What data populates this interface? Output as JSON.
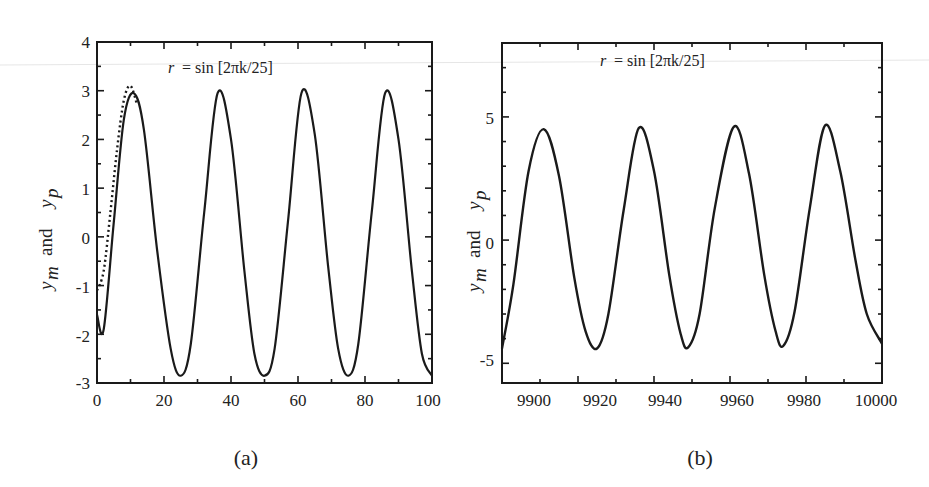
{
  "chart_data": [
    {
      "panel": "(a)",
      "type": "line",
      "annotation": "r = sin[2πk/25]",
      "ylabel": "y_m and y_p",
      "xlabel": "",
      "xlim": [
        0,
        100
      ],
      "ylim": [
        -3,
        4
      ],
      "xticks": [
        0,
        20,
        40,
        60,
        80,
        100
      ],
      "yticks": [
        -3,
        -2,
        -1,
        0,
        1,
        2,
        3,
        4
      ],
      "grid": false,
      "legend": null,
      "series": [
        {
          "name": "y_m (solid)",
          "style": "solid",
          "x": [
            0,
            2,
            5,
            8,
            11,
            14,
            18,
            22,
            25,
            28,
            32,
            36,
            40,
            44,
            47,
            50,
            53,
            57,
            61,
            65,
            69,
            72,
            75,
            78,
            82,
            86,
            90,
            94,
            97,
            100
          ],
          "y": [
            -1.6,
            -1.9,
            0.3,
            2.4,
            2.95,
            2.2,
            -0.3,
            -2.3,
            -2.85,
            -2.2,
            0.5,
            2.95,
            2.0,
            -0.7,
            -2.4,
            -2.85,
            -2.3,
            0.3,
            2.95,
            2.1,
            -0.6,
            -2.3,
            -2.85,
            -2.2,
            0.5,
            2.95,
            2.0,
            -0.7,
            -2.4,
            -2.85
          ]
        },
        {
          "name": "y_p (dotted)",
          "style": "dotted",
          "x": [
            0,
            2,
            4,
            6,
            8,
            10,
            12
          ],
          "y": [
            -1.1,
            -0.7,
            0.5,
            1.8,
            2.8,
            3.1,
            2.7
          ]
        }
      ]
    },
    {
      "panel": "(b)",
      "type": "line",
      "annotation": "r = sin[2πk/25]",
      "ylabel": "y_m and y_p",
      "xlabel": "",
      "xlim": [
        9900,
        10000
      ],
      "ylim": [
        -5.8,
        8
      ],
      "xticks": [
        9900,
        9920,
        9940,
        9960,
        9980,
        10000
      ],
      "yticks": [
        -5,
        0,
        5
      ],
      "grid": false,
      "legend": null,
      "series": [
        {
          "name": "y_m and y_p (overlapping)",
          "style": "solid",
          "x": [
            9900,
            9903,
            9907,
            9911,
            9915,
            9919,
            9922,
            9925,
            9928,
            9932,
            9936,
            9940,
            9944,
            9947,
            9949,
            9952,
            9956,
            9961,
            9965,
            9969,
            9972,
            9974,
            9977,
            9981,
            9985,
            9989,
            9993,
            9996,
            10000
          ],
          "y": [
            -4.4,
            -1.8,
            2.8,
            4.5,
            2.6,
            -1.5,
            -3.7,
            -4.4,
            -3.0,
            1.2,
            4.55,
            2.8,
            -1.4,
            -3.8,
            -4.35,
            -3.0,
            1.3,
            4.6,
            2.7,
            -1.4,
            -3.7,
            -4.3,
            -2.9,
            1.3,
            4.65,
            2.8,
            -0.8,
            -3.0,
            -4.2
          ]
        }
      ]
    }
  ],
  "panels": {
    "a": {
      "caption": "(a)",
      "annotation_lhs": "r",
      "annotation_rhs": "=  sin [2πk/25]",
      "ylabel_main": "y",
      "ylabel_sub_m": "m",
      "ylabel_and": "and",
      "ylabel_sub_p": "p",
      "xtick_labels": [
        "0",
        "20",
        "40",
        "60",
        "80",
        "100"
      ],
      "ytick_labels": [
        "4",
        "3",
        "2",
        "1",
        "0",
        "-1",
        "-2",
        "-3"
      ]
    },
    "b": {
      "caption": "(b)",
      "annotation_lhs": "r",
      "annotation_rhs": "=  sin [2πk/25]",
      "ylabel_main": "y",
      "ylabel_sub_m": "m",
      "ylabel_and": "and",
      "ylabel_sub_p": "p",
      "xtick_labels": [
        "9900",
        "9920",
        "9940",
        "9960",
        "9980",
        "10000"
      ],
      "ytick_labels": [
        "5",
        "0",
        "-5"
      ]
    }
  },
  "colors": {
    "ink": "#1a1a1a",
    "background": "#ffffff"
  }
}
